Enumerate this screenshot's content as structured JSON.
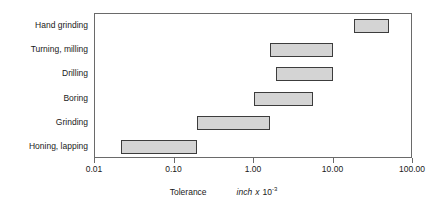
{
  "chart_data": {
    "type": "bar",
    "orientation": "horizontal-range",
    "title": "",
    "xlabel": "Tolerance",
    "xlabel_unit_italic": "inch",
    "xlabel_times": "x",
    "xlabel_base": "10",
    "xlabel_exponent": "-3",
    "ylabel": "",
    "xscale": "log",
    "xlim": [
      0.01,
      100
    ],
    "grid": false,
    "legend": false,
    "xticks": [
      0.01,
      0.1,
      1,
      10,
      100
    ],
    "xticklabels": [
      "0.01",
      "0.10",
      "1.00",
      "10.00",
      "100.00"
    ],
    "categories": [
      "Hand grinding",
      "Turning, milling",
      "Drilling",
      "Boring",
      "Grinding",
      "Honing, lapping"
    ],
    "ranges": [
      {
        "category": "Hand grinding",
        "low": 18.0,
        "high": 50.0
      },
      {
        "category": "Turning, milling",
        "low": 1.6,
        "high": 10.0
      },
      {
        "category": "Drilling",
        "low": 1.9,
        "high": 10.0
      },
      {
        "category": "Boring",
        "low": 1.0,
        "high": 5.5
      },
      {
        "category": "Grinding",
        "low": 0.19,
        "high": 1.6
      },
      {
        "category": "Honing, lapping",
        "low": 0.021,
        "high": 0.19
      }
    ],
    "bar_fill_color": "#d4d4d4",
    "bar_edge_color": "#3c3c3c",
    "axis_color": "#6a6a6a",
    "text_color": "#1a1a1a",
    "background_color": "#ffffff"
  }
}
